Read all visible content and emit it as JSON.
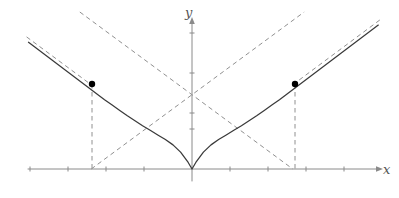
{
  "figure": {
    "title": "",
    "width": 399,
    "height": 198,
    "background": "#ffffff"
  },
  "axes": {
    "x_label": "x",
    "y_label": "y",
    "x_axis_color": "#8a8a8a",
    "y_axis_color": "#8a8a8a",
    "origin_px": {
      "x": 192,
      "y": 169
    },
    "x_axis_px": {
      "start": 28,
      "end": 378,
      "y": 169
    },
    "y_axis_px": {
      "top": 22,
      "bottom": 181,
      "x": 192
    },
    "x_arrow": true,
    "y_arrow": true,
    "x_tick_spacing_px": 38,
    "y_tick_spacing_px": 40,
    "x_ticks_px": [
      30,
      68,
      106,
      144,
      230,
      268,
      306,
      344
    ],
    "y_ticks_px": [
      33,
      73,
      113,
      129
    ],
    "tick_length_px": 5,
    "tick_color": "#8a8a8a",
    "tick_labels_shown": false
  },
  "chart_data": {
    "type": "line",
    "title": "",
    "xlabel": "x",
    "ylabel": "y",
    "grid": false,
    "legend": "none",
    "xlim": [
      -4.3,
      4.9
    ],
    "ylim": [
      -0.3,
      3.7
    ],
    "series": [
      {
        "name": "curve",
        "style": "solid",
        "color": "#3a3a3a",
        "x": [
          -4.3,
          -4.1,
          -3.9,
          -3.7,
          -3.5,
          -3.3,
          -3.1,
          -2.9,
          -2.7,
          -2.5,
          -2.3,
          -2.1,
          -1.9,
          -1.7,
          -1.5,
          -1.3,
          -1.1,
          -0.9,
          -0.7,
          -0.5,
          -0.3,
          -0.1,
          0.0,
          0.1,
          0.3,
          0.5,
          0.7,
          0.9,
          1.1,
          1.3,
          1.5,
          1.7,
          1.9,
          2.1,
          2.3,
          2.5,
          2.7,
          2.9,
          3.1,
          3.3,
          3.5,
          3.7,
          3.9,
          4.1,
          4.3,
          4.5,
          4.7,
          4.9
        ],
        "y": [
          3.31,
          3.16,
          3.01,
          2.86,
          2.71,
          2.56,
          2.41,
          2.26,
          2.11,
          1.96,
          1.81,
          1.67,
          1.53,
          1.39,
          1.26,
          1.13,
          1.01,
          0.89,
          0.77,
          0.63,
          0.44,
          0.17,
          0.0,
          0.17,
          0.44,
          0.63,
          0.77,
          0.89,
          1.01,
          1.13,
          1.26,
          1.39,
          1.53,
          1.67,
          1.81,
          1.96,
          2.11,
          2.26,
          2.41,
          2.56,
          2.71,
          2.86,
          3.01,
          3.16,
          3.31,
          3.46,
          3.61,
          3.76
        ]
      },
      {
        "name": "left-asymptote-tangent",
        "style": "dashed",
        "color": "#909090",
        "x": [
          -4.35,
          -2.65
        ],
        "y": [
          3.45,
          2.2
        ]
      },
      {
        "name": "right-asymptote-tangent",
        "style": "dashed",
        "color": "#909090",
        "x": [
          2.65,
          4.95
        ],
        "y": [
          2.2,
          3.9
        ]
      },
      {
        "name": "rising-asymptote",
        "style": "dashed",
        "color": "#909090",
        "x": [
          -2.65,
          2.95
        ],
        "y": [
          0.0,
          4.1
        ]
      },
      {
        "name": "falling-asymptote",
        "style": "dashed",
        "color": "#909090",
        "x": [
          -2.95,
          2.65
        ],
        "y": [
          4.1,
          0.0
        ]
      }
    ],
    "points": [
      {
        "name": "left-marked-point",
        "x": -2.63,
        "y": 2.22,
        "px": {
          "x": 92,
          "y": 84
        },
        "marker": "filled-circle",
        "color": "#000000",
        "radius_px": 3.2
      },
      {
        "name": "right-marked-point",
        "x": 2.71,
        "y": 2.22,
        "px": {
          "x": 295,
          "y": 84
        },
        "marker": "filled-circle",
        "color": "#000000",
        "radius_px": 3.2
      }
    ],
    "droplines": [
      {
        "name": "left-dropline",
        "style": "dashed",
        "color": "#909090",
        "from_px": {
          "x": 92,
          "y": 84
        },
        "to_px": {
          "x": 92,
          "y": 169
        }
      },
      {
        "name": "right-dropline",
        "style": "dashed",
        "color": "#909090",
        "from_px": {
          "x": 295,
          "y": 84
        },
        "to_px": {
          "x": 295,
          "y": 169
        }
      }
    ],
    "asymptote_intersection_px": {
      "x": 192,
      "y": 125
    }
  }
}
